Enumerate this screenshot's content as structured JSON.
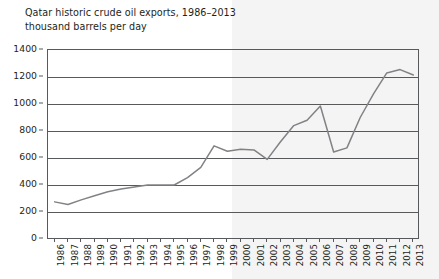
{
  "chart_data": {
    "type": "line",
    "title": "Qatar historic crude oil exports, 1986–2013",
    "subtitle": "thousand barrels per day",
    "xlabel": "",
    "ylabel": "thousand barrels per day",
    "ylim": [
      0,
      1400
    ],
    "ytick_step": 200,
    "ytick_labels": [
      "0",
      "200",
      "400",
      "600",
      "800",
      "1000",
      "1200",
      "1400"
    ],
    "grid": true,
    "legend": "none",
    "line_color": "#808285",
    "axis_color": "#58595b",
    "shaded_band": {
      "from_year": 2000,
      "to_year": 2013,
      "color": "#f4f4f4"
    },
    "categories": [
      "1986",
      "1987",
      "1988",
      "1989",
      "1990",
      "1991",
      "1992",
      "1993",
      "1994",
      "1995",
      "1996",
      "1997",
      "1998",
      "1999",
      "2000",
      "2001",
      "2002",
      "2003",
      "2004",
      "2005",
      "2006",
      "2007",
      "2008",
      "2009",
      "2010",
      "2011",
      "2012",
      "2013"
    ],
    "series": [
      {
        "name": "Qatar crude oil exports",
        "values": [
          275,
          255,
          290,
          320,
          350,
          370,
          385,
          400,
          400,
          400,
          455,
          530,
          690,
          650,
          665,
          660,
          590,
          720,
          840,
          880,
          985,
          645,
          675,
          900,
          1075,
          1230,
          1255,
          1215
        ]
      }
    ]
  },
  "figure": {
    "title_line1": "Qatar historic crude oil exports, 1986–2013",
    "title_line2": "thousand barrels per day"
  }
}
